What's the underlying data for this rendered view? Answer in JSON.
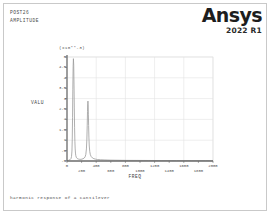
{
  "header": {
    "line1": "POST26",
    "line2": "AMPLITUDE"
  },
  "brand": {
    "name": "Ansys",
    "version": "2022 R1"
  },
  "caption": "harmonic response of a cantilever",
  "colors": {
    "curve": "#9a9a9a",
    "axis": "#6e6e6e",
    "grid": "#e2e2e2",
    "frame": "#c9c9c9",
    "text": "#4a4a4a"
  },
  "chart_data": {
    "type": "line",
    "title": "",
    "subtitle": "",
    "xlabel": "FREQ",
    "ylabel": "VALU",
    "scale_note": "(x10**-3)",
    "grid": true,
    "legend": "none",
    "xlim": [
      0,
      2000
    ],
    "ylim": [
      0,
      5
    ],
    "xticks": [
      0,
      200,
      400,
      600,
      800,
      1000,
      1200,
      1400,
      1600,
      1800,
      2000
    ],
    "xtick_labels": [
      "0",
      "200",
      "400",
      "600",
      "800",
      "1000",
      "1200",
      "1400",
      "1600",
      "1800",
      "2000"
    ],
    "yticks": [
      0,
      0.5,
      1,
      1.5,
      2,
      2.5,
      3,
      3.5,
      4,
      4.5,
      5
    ],
    "ytick_labels": [
      ".0",
      ".5",
      "1",
      "1.5",
      "2",
      "2.5",
      "3",
      "3.5",
      "4",
      "4.5",
      "5"
    ],
    "series": [
      {
        "name": "AMPLITUDE",
        "x": [
          0,
          20,
          40,
          55,
          62,
          68,
          72,
          76,
          80,
          84,
          88,
          92,
          96,
          100,
          104,
          108,
          112,
          116,
          120,
          126,
          132,
          140,
          150,
          160,
          175,
          190,
          205,
          220,
          235,
          248,
          258,
          266,
          272,
          277,
          281,
          284,
          287,
          290,
          293,
          296,
          300,
          305,
          312,
          320,
          332,
          348,
          368,
          392,
          420,
          460,
          520,
          600,
          700,
          820,
          960,
          1120,
          1300,
          1500,
          1700,
          1900,
          2000
        ],
        "y": [
          0.02,
          0.03,
          0.06,
          0.12,
          0.22,
          0.48,
          1.05,
          2.1,
          3.45,
          4.55,
          4.92,
          4.6,
          3.7,
          2.55,
          1.6,
          0.95,
          0.58,
          0.38,
          0.27,
          0.19,
          0.15,
          0.12,
          0.1,
          0.09,
          0.08,
          0.08,
          0.09,
          0.11,
          0.14,
          0.2,
          0.32,
          0.58,
          1.05,
          1.72,
          2.38,
          2.76,
          2.88,
          2.7,
          2.25,
          1.7,
          1.15,
          0.72,
          0.45,
          0.3,
          0.21,
          0.15,
          0.11,
          0.09,
          0.07,
          0.06,
          0.05,
          0.04,
          0.035,
          0.03,
          0.028,
          0.025,
          0.022,
          0.02,
          0.018,
          0.016,
          0.015
        ]
      }
    ]
  }
}
